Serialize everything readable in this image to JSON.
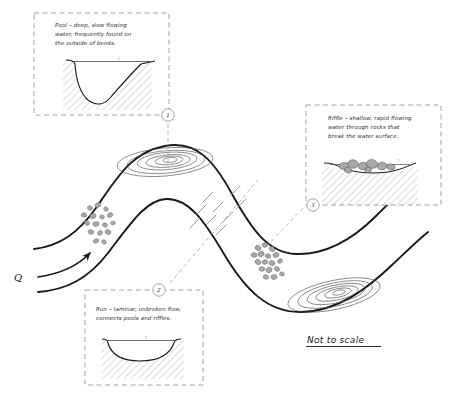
{
  "diagram": {
    "scale_note": "Not to scale",
    "discharge_label": "Q",
    "colors": {
      "channel_line": "#1a1a1a",
      "contour_line": "#4a4a4a",
      "callout_border": "#8a8a8a",
      "hatch": "#9a9a9a",
      "rock_fill": "#a8a8a8",
      "rock_stroke": "#6a6a6a",
      "text": "#2b2b2b",
      "flow_line": "#8c8c8c"
    }
  },
  "callouts": [
    {
      "id": "pool",
      "marker": "1",
      "lines": [
        "Pool – deep, slow flowing",
        "water, frequently found on",
        "the outside of bends."
      ],
      "cross_section": "asymmetric-deep-channel",
      "water_level_tick": "▽"
    },
    {
      "id": "run",
      "marker": "2",
      "lines": [
        "Run – laminar, unbroken flow,",
        "connects pools and riffles."
      ],
      "cross_section": "shallow-symmetric-channel",
      "water_level_tick": "▽"
    },
    {
      "id": "riffle",
      "marker": "3",
      "lines": [
        "Riffle – shallow, rapid flowing",
        "water through rocks that",
        "break the water surface."
      ],
      "cross_section": "rocks-breaking-surface",
      "water_level_tick": "▽"
    }
  ],
  "map_features": [
    {
      "id": "pool-upper-left",
      "type": "pool-contours",
      "rings": 6,
      "marker_ref": "1"
    },
    {
      "id": "pool-lower-right",
      "type": "pool-contours",
      "rings": 6,
      "marker_ref": "1"
    },
    {
      "id": "point-bar-gravel",
      "type": "gravel-scatter",
      "count": 16
    },
    {
      "id": "riffle-rocks",
      "type": "rock-cluster",
      "count": 17,
      "marker_ref": "3"
    },
    {
      "id": "run-flow-lines",
      "type": "laminar-dashes",
      "count": 9,
      "marker_ref": "2"
    },
    {
      "id": "discharge-arrow",
      "type": "curved-arrow",
      "label": "Q"
    }
  ]
}
